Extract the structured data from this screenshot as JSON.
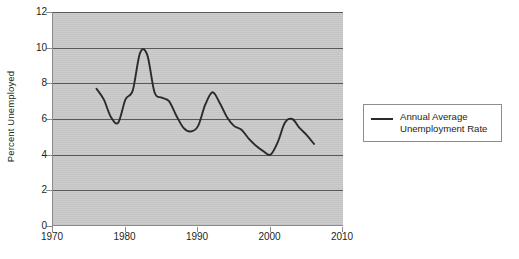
{
  "chart_data": {
    "type": "line",
    "title": "",
    "subtitle": "",
    "xlabel": "",
    "ylabel": "Percent Unemployed",
    "xlim": [
      1970,
      2010
    ],
    "ylim": [
      0,
      12
    ],
    "xticks": [
      1970,
      1980,
      1990,
      2000,
      2010
    ],
    "xticklabels": [
      "1970",
      "1980",
      "1990",
      "2000",
      "2010"
    ],
    "yticks": [
      0,
      2,
      4,
      6,
      8,
      10,
      12
    ],
    "yticklabels": [
      "0",
      "2",
      "4",
      "6",
      "8",
      "10",
      "12"
    ],
    "grid": "horizontal",
    "legend_position": "right",
    "plot_background": "#c9c9c9",
    "page_background": "#ffffff",
    "line_color": "#2b2b2b",
    "gridline_color": "#595959",
    "series": [
      {
        "name": "Annual Average Unemployment Rate",
        "x": [
          1976,
          1977,
          1978,
          1979,
          1980,
          1981,
          1982,
          1983,
          1984,
          1985,
          1986,
          1987,
          1988,
          1989,
          1990,
          1991,
          1992,
          1993,
          1994,
          1995,
          1996,
          1997,
          1998,
          1999,
          2000,
          2001,
          2002,
          2003,
          2004,
          2005,
          2006
        ],
        "values": [
          7.7,
          7.1,
          6.1,
          5.8,
          7.1,
          7.6,
          9.7,
          9.6,
          7.5,
          7.2,
          7.0,
          6.2,
          5.5,
          5.3,
          5.6,
          6.8,
          7.5,
          6.9,
          6.1,
          5.6,
          5.4,
          4.9,
          4.5,
          4.2,
          4.0,
          4.7,
          5.8,
          6.0,
          5.5,
          5.1,
          4.6
        ]
      }
    ]
  },
  "legend": {
    "entries": [
      {
        "label": "Annual Average\nUnemployment Rate",
        "color": "#2b2b2b",
        "marker": "line"
      }
    ]
  }
}
